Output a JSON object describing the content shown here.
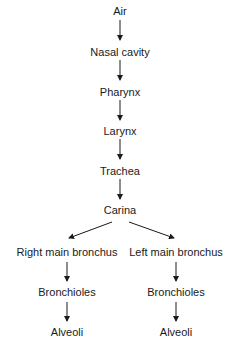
{
  "diagram": {
    "type": "flowchart",
    "title": "",
    "nodes": [
      {
        "id": "air",
        "label": "Air",
        "x": 120,
        "y": 11
      },
      {
        "id": "nasal",
        "label": "Nasal cavity",
        "x": 120,
        "y": 52
      },
      {
        "id": "pharynx",
        "label": "Pharynx",
        "x": 120,
        "y": 92
      },
      {
        "id": "larynx",
        "label": "Larynx",
        "x": 120,
        "y": 131
      },
      {
        "id": "trachea",
        "label": "Trachea",
        "x": 120,
        "y": 171
      },
      {
        "id": "carina",
        "label": "Carina",
        "x": 120,
        "y": 210
      },
      {
        "id": "right_bronchus",
        "label": "Right main bronchus",
        "x": 67,
        "y": 252
      },
      {
        "id": "left_bronchus",
        "label": "Left main bronchus",
        "x": 176,
        "y": 252
      },
      {
        "id": "right_bronchioles",
        "label": "Bronchioles",
        "x": 67,
        "y": 292
      },
      {
        "id": "left_bronchioles",
        "label": "Bronchioles",
        "x": 176,
        "y": 292
      },
      {
        "id": "right_alveoli",
        "label": "Alveoli",
        "x": 67,
        "y": 332
      },
      {
        "id": "left_alveoli",
        "label": "Alveoli",
        "x": 176,
        "y": 332
      }
    ],
    "edges": [
      {
        "from": "air",
        "to": "nasal",
        "x1": 120,
        "y1": 20,
        "x2": 120,
        "y2": 40
      },
      {
        "from": "nasal",
        "to": "pharynx",
        "x1": 120,
        "y1": 60,
        "x2": 120,
        "y2": 80
      },
      {
        "from": "pharynx",
        "to": "larynx",
        "x1": 120,
        "y1": 100,
        "x2": 120,
        "y2": 120
      },
      {
        "from": "larynx",
        "to": "trachea",
        "x1": 120,
        "y1": 139,
        "x2": 120,
        "y2": 159
      },
      {
        "from": "trachea",
        "to": "carina",
        "x1": 120,
        "y1": 179,
        "x2": 120,
        "y2": 199
      },
      {
        "from": "carina",
        "to": "right_bronchus",
        "x1": 112,
        "y1": 222,
        "x2": 69,
        "y2": 238
      },
      {
        "from": "carina",
        "to": "left_bronchus",
        "x1": 129,
        "y1": 222,
        "x2": 174,
        "y2": 238
      },
      {
        "from": "right_bronchus",
        "to": "right_bronchioles",
        "x1": 67,
        "y1": 262,
        "x2": 67,
        "y2": 281
      },
      {
        "from": "left_bronchus",
        "to": "left_bronchioles",
        "x1": 176,
        "y1": 262,
        "x2": 176,
        "y2": 281
      },
      {
        "from": "right_bronchioles",
        "to": "right_alveoli",
        "x1": 67,
        "y1": 302,
        "x2": 67,
        "y2": 321
      },
      {
        "from": "left_bronchioles",
        "to": "left_alveoli",
        "x1": 176,
        "y1": 302,
        "x2": 176,
        "y2": 321
      }
    ],
    "colors": {
      "text": "#1a1a1a",
      "arrow": "#1a1a1a",
      "background": "#ffffff"
    }
  }
}
